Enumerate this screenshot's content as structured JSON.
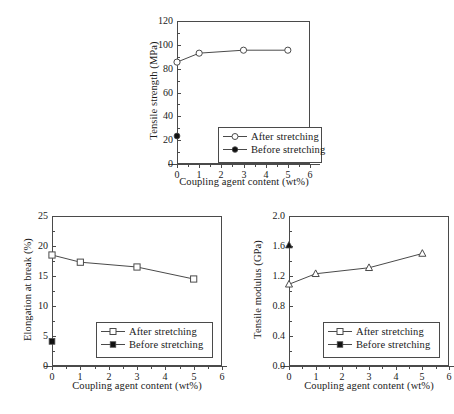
{
  "figure": {
    "background": "#ffffff",
    "line_color": "#4a4a4a",
    "marker_fill": "#111111"
  },
  "legend_labels": {
    "after": "After stretching",
    "before": "Before stretching"
  },
  "chart_data": [
    {
      "id": "tensile-strength",
      "type": "line",
      "title": "",
      "xlabel": "Coupling agent content (wt%)",
      "ylabel": "Tensile strength (MPa)",
      "xlim": [
        0,
        6
      ],
      "ylim": [
        0,
        120
      ],
      "xticks": [
        0,
        1,
        2,
        3,
        4,
        5,
        6
      ],
      "xticklabels": [
        "0",
        "1",
        "2",
        "3",
        "4",
        "5",
        "6"
      ],
      "yticks": [
        0,
        20,
        40,
        60,
        80,
        100,
        120
      ],
      "yticklabels": [
        "0",
        "20",
        "40",
        "60",
        "80",
        "100",
        "120"
      ],
      "grid": false,
      "legend_position": "lower right",
      "series": [
        {
          "name": "After stretching",
          "marker": "circle-open",
          "x": [
            0,
            1,
            3,
            5
          ],
          "values": [
            85.5,
            93.0,
            95.5,
            95.5
          ]
        },
        {
          "name": "Before stretching",
          "marker": "circle-filled",
          "x": [
            0
          ],
          "values": [
            23.5
          ]
        }
      ]
    },
    {
      "id": "elongation-at-break",
      "type": "line",
      "title": "",
      "xlabel": "Coupling agent content (wt%)",
      "ylabel": "Elongation at break (%)",
      "xlim": [
        0,
        6
      ],
      "ylim": [
        0,
        25
      ],
      "xticks": [
        0,
        1,
        2,
        3,
        4,
        5,
        6
      ],
      "xticklabels": [
        "0",
        "1",
        "2",
        "3",
        "4",
        "5",
        "6"
      ],
      "yticks": [
        0,
        5,
        10,
        15,
        20,
        25
      ],
      "yticklabels": [
        "0",
        "5",
        "10",
        "15",
        "20",
        "25"
      ],
      "grid": false,
      "legend_position": "lower right",
      "series": [
        {
          "name": "After stretching",
          "marker": "square-open",
          "x": [
            0,
            1,
            3,
            5
          ],
          "values": [
            18.5,
            17.3,
            16.5,
            14.5
          ]
        },
        {
          "name": "Before stretching",
          "marker": "square-filled",
          "x": [
            0
          ],
          "values": [
            4.1
          ]
        }
      ]
    },
    {
      "id": "tensile-modulus",
      "type": "line",
      "title": "",
      "xlabel": "Coupling agent content (wt%)",
      "ylabel": "Tensile modulus (GPa)",
      "xlim": [
        0,
        6
      ],
      "ylim": [
        0.0,
        2.0
      ],
      "xticks": [
        0,
        1,
        2,
        3,
        4,
        5,
        6
      ],
      "xticklabels": [
        "0",
        "1",
        "2",
        "3",
        "4",
        "5",
        "6"
      ],
      "yticks": [
        0.0,
        0.4,
        0.8,
        1.2,
        1.6,
        2.0
      ],
      "yticklabels": [
        "0.0",
        "0.4",
        "0.8",
        "1.2",
        "1.6",
        "2.0"
      ],
      "grid": false,
      "legend_position": "lower right",
      "series": [
        {
          "name": "After stretching",
          "marker": "triangle-open",
          "x": [
            0,
            1,
            3,
            5
          ],
          "values": [
            1.09,
            1.23,
            1.31,
            1.5
          ]
        },
        {
          "name": "Before stretching",
          "marker": "triangle-filled",
          "x": [
            0
          ],
          "values": [
            1.61
          ]
        }
      ]
    }
  ]
}
